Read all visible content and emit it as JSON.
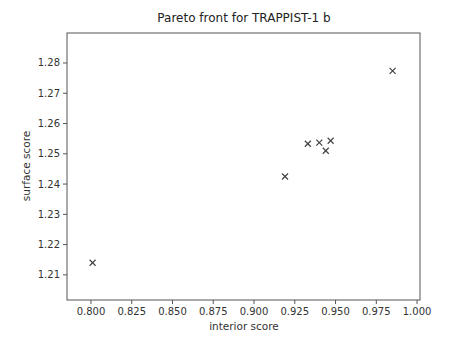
{
  "chart_data": {
    "type": "scatter",
    "title": "Pareto front for TRAPPIST-1 b",
    "xlabel": "interior score",
    "ylabel": "surface score",
    "xlim": [
      0.7853,
      1.0018
    ],
    "ylim": [
      1.2017,
      1.2899
    ],
    "x_ticks": [
      0.8,
      0.825,
      0.85,
      0.875,
      0.9,
      0.925,
      0.95,
      0.975,
      1.0
    ],
    "x_tick_labels": [
      "0.800",
      "0.825",
      "0.850",
      "0.875",
      "0.900",
      "0.925",
      "0.950",
      "0.975",
      "1.000"
    ],
    "y_ticks": [
      1.21,
      1.22,
      1.23,
      1.24,
      1.25,
      1.26,
      1.27,
      1.28
    ],
    "y_tick_labels": [
      "1.21",
      "1.22",
      "1.23",
      "1.24",
      "1.25",
      "1.26",
      "1.27",
      "1.28"
    ],
    "grid": false,
    "legend": null,
    "marker": "x",
    "marker_color": "#444444",
    "series": [
      {
        "name": "pareto front",
        "points": [
          {
            "x": 0.801,
            "y": 1.214
          },
          {
            "x": 0.919,
            "y": 1.2425
          },
          {
            "x": 0.933,
            "y": 1.2533
          },
          {
            "x": 0.94,
            "y": 1.2537
          },
          {
            "x": 0.947,
            "y": 1.2543
          },
          {
            "x": 0.944,
            "y": 1.251
          },
          {
            "x": 0.985,
            "y": 1.2774
          }
        ]
      }
    ]
  }
}
